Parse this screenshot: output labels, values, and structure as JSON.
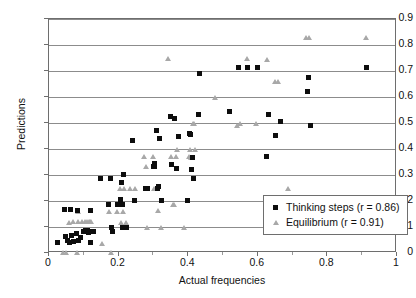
{
  "chart_data": {
    "type": "scatter",
    "title": "",
    "xlabel": "Actual frequencies",
    "ylabel": "Predictions",
    "xlim": [
      0,
      1
    ],
    "ylim": [
      0,
      0.9
    ],
    "xticks": [
      "0",
      "0.2",
      "0.4",
      "0.6",
      "0.8",
      "1"
    ],
    "xtick_values": [
      0,
      0.2,
      0.4,
      0.6,
      0.8,
      1
    ],
    "yticks": [
      "0",
      "0.1",
      "0.2",
      "0.3",
      "0.4",
      "0.5",
      "0.6",
      "0.7",
      "0.8",
      "0.9"
    ],
    "ytick_values": [
      0,
      0.1,
      0.2,
      0.3,
      0.4,
      0.5,
      0.6,
      0.7,
      0.8,
      0.9
    ],
    "grid": "horizontal",
    "legend_position": "lower-right-inside",
    "series": [
      {
        "name": "Thinking steps (r = 0.86)",
        "label": "Thinking steps (r = 0.86)",
        "marker": "square",
        "color": "#0d0d0d",
        "correlation": 0.86,
        "points": [
          [
            0.025,
            0.04
          ],
          [
            0.045,
            0.168
          ],
          [
            0.048,
            0.062
          ],
          [
            0.052,
            0.05
          ],
          [
            0.058,
            0.04
          ],
          [
            0.062,
            0.168
          ],
          [
            0.065,
            0.068
          ],
          [
            0.07,
            0.043
          ],
          [
            0.078,
            0.075
          ],
          [
            0.082,
            0.163
          ],
          [
            0.085,
            0.048
          ],
          [
            0.09,
            0.058
          ],
          [
            0.098,
            0.083
          ],
          [
            0.104,
            0.085
          ],
          [
            0.11,
            0.085
          ],
          [
            0.113,
            0.08
          ],
          [
            0.118,
            0.163
          ],
          [
            0.12,
            0.04
          ],
          [
            0.124,
            0.083
          ],
          [
            0.128,
            0.083
          ],
          [
            0.148,
            0.288
          ],
          [
            0.17,
            0.185
          ],
          [
            0.176,
            0.288
          ],
          [
            0.18,
            0.1
          ],
          [
            0.182,
            0.082
          ],
          [
            0.196,
            0.185
          ],
          [
            0.205,
            0.207
          ],
          [
            0.208,
            0.272
          ],
          [
            0.21,
            0.188
          ],
          [
            0.212,
            0.1
          ],
          [
            0.214,
            0.302
          ],
          [
            0.218,
            0.098
          ],
          [
            0.222,
            0.1
          ],
          [
            0.24,
            0.432
          ],
          [
            0.246,
            0.202
          ],
          [
            0.276,
            0.248
          ],
          [
            0.282,
            0.247
          ],
          [
            0.3,
            0.334
          ],
          [
            0.302,
            0.332
          ],
          [
            0.304,
            0.345
          ],
          [
            0.308,
            0.472
          ],
          [
            0.312,
            0.25
          ],
          [
            0.316,
            0.254
          ],
          [
            0.318,
            0.441
          ],
          [
            0.322,
            0.202
          ],
          [
            0.348,
            0.524
          ],
          [
            0.352,
            0.34
          ],
          [
            0.362,
            0.519
          ],
          [
            0.366,
            0.325
          ],
          [
            0.372,
            0.447
          ],
          [
            0.398,
            0.202
          ],
          [
            0.405,
            0.458
          ],
          [
            0.408,
            0.455
          ],
          [
            0.41,
            0.322
          ],
          [
            0.412,
            0.368
          ],
          [
            0.414,
            0.285
          ],
          [
            0.43,
            0.533
          ],
          [
            0.432,
            0.691
          ],
          [
            0.52,
            0.543
          ],
          [
            0.545,
            0.714
          ],
          [
            0.57,
            0.714
          ],
          [
            0.6,
            0.714
          ],
          [
            0.625,
            0.37
          ],
          [
            0.632,
            0.533
          ],
          [
            0.652,
            0.453
          ],
          [
            0.665,
            0.506
          ],
          [
            0.742,
            0.621
          ],
          [
            0.745,
            0.676
          ],
          [
            0.75,
            0.492
          ],
          [
            0.912,
            0.713
          ]
        ]
      },
      {
        "name": "Equilibrium (r = 0.91)",
        "label": "Equilibrium (r = 0.91)",
        "marker": "triangle",
        "color": "#a8a8a8",
        "correlation": 0.91,
        "points": [
          [
            0.04,
            0.002
          ],
          [
            0.048,
            0.002
          ],
          [
            0.058,
            0.118
          ],
          [
            0.07,
            0.12
          ],
          [
            0.08,
            0.002
          ],
          [
            0.082,
            0.16
          ],
          [
            0.084,
            0.12
          ],
          [
            0.096,
            0.12
          ],
          [
            0.104,
            0.12
          ],
          [
            0.11,
            0.12
          ],
          [
            0.114,
            0.12
          ],
          [
            0.118,
            0.12
          ],
          [
            0.122,
            0.12
          ],
          [
            0.152,
            0.038
          ],
          [
            0.172,
            0.16
          ],
          [
            0.178,
            0.002
          ],
          [
            0.196,
            0.16
          ],
          [
            0.204,
            0.248
          ],
          [
            0.208,
            0.118
          ],
          [
            0.212,
            0.16
          ],
          [
            0.216,
            0.248
          ],
          [
            0.222,
            0.118
          ],
          [
            0.234,
            0.248
          ],
          [
            0.248,
            0.248
          ],
          [
            0.272,
            0.372
          ],
          [
            0.278,
            0.332
          ],
          [
            0.282,
            0.098
          ],
          [
            0.298,
            0.372
          ],
          [
            0.302,
            0.248
          ],
          [
            0.312,
            0.165
          ],
          [
            0.322,
            0.098
          ],
          [
            0.342,
            0.748
          ],
          [
            0.35,
            0.372
          ],
          [
            0.356,
            0.185
          ],
          [
            0.36,
            0.186
          ],
          [
            0.364,
            0.372
          ],
          [
            0.368,
            0.4
          ],
          [
            0.388,
            0.098
          ],
          [
            0.402,
            0.372
          ],
          [
            0.404,
            0.4
          ],
          [
            0.408,
            0.368
          ],
          [
            0.412,
            0.368
          ],
          [
            0.414,
            0.498
          ],
          [
            0.416,
            0.498
          ],
          [
            0.42,
            0.4
          ],
          [
            0.478,
            0.598
          ],
          [
            0.54,
            0.492
          ],
          [
            0.548,
            0.498
          ],
          [
            0.568,
            0.748
          ],
          [
            0.596,
            0.498
          ],
          [
            0.625,
            0.745
          ],
          [
            0.65,
            0.66
          ],
          [
            0.658,
            0.66
          ],
          [
            0.688,
            0.247
          ],
          [
            0.738,
            0.83
          ],
          [
            0.748,
            0.83
          ],
          [
            0.912,
            0.828
          ]
        ]
      }
    ]
  },
  "legend": {
    "items": [
      {
        "marker": "square-marker",
        "label": "Thinking steps (r = 0.86)"
      },
      {
        "marker": "triangle-marker",
        "label": "Equilibrium (r = 0.91)"
      }
    ]
  }
}
